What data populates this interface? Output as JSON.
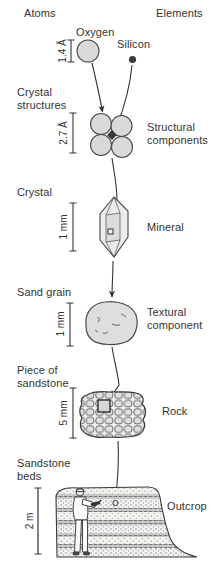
{
  "header": {
    "left_label": "Atoms",
    "right_label": "Elements"
  },
  "atoms": {
    "oxygen_label": "Oxygen",
    "silicon_label": "Silicon",
    "scale": "1.4 Å"
  },
  "levels": [
    {
      "id": "crystal-structures",
      "left_label": "Crystal structures",
      "right_label": "Structural components",
      "scale": "2.7 Å"
    },
    {
      "id": "crystal",
      "left_label": "Crystal",
      "right_label": "Mineral",
      "scale": "1 mm"
    },
    {
      "id": "sand-grain",
      "left_label": "Sand grain",
      "right_label": "Textural component",
      "scale": "1 mm"
    },
    {
      "id": "piece-of-sandstone",
      "left_label": "Piece of sandstone",
      "right_label": "Rock",
      "scale": "5 mm"
    },
    {
      "id": "sandstone-beds",
      "left_label": "Sandstone beds",
      "right_label": "Outcrop",
      "scale": "2 m"
    }
  ],
  "colors": {
    "background": "#ffffff",
    "text": "#333333",
    "atom_fill": "#d9d9d9",
    "outline": "#4a4a4a",
    "silicon_fill": "#3a3a3a",
    "crystal_fill": "#ececec",
    "rock_grain_fill": "#e0e0e0"
  }
}
